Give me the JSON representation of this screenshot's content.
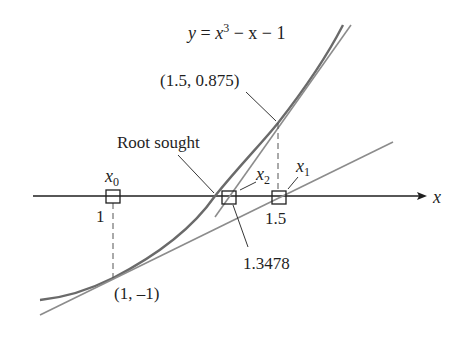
{
  "figure": {
    "equation": {
      "lhs": "y",
      "eq": " = ",
      "x3_base": "x",
      "x3_exp": "3",
      "rest": " − x − 1"
    },
    "labels": {
      "point_top": "(1.5, 0.875)",
      "point_bottom": "(1, –1)",
      "root_sought": "Root sought",
      "root_value": "1.3478",
      "axis_x": "x",
      "x0_base": "x",
      "x0_sub": "0",
      "x1_base": "x",
      "x1_sub": "1",
      "x2_base": "x",
      "x2_sub": "2",
      "tick_1": "1",
      "tick_1_5": "1.5"
    },
    "colors": {
      "curve": "#6a6a6a",
      "tangent": "#8c8c8c",
      "axis": "#1f1f1f",
      "text": "#1f1f1f"
    }
  }
}
